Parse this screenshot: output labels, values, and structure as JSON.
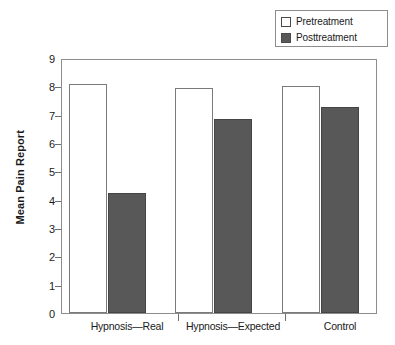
{
  "chart_data": {
    "type": "bar",
    "title": "",
    "xlabel": "",
    "ylabel": "Mean Pain Report",
    "ylim": [
      0,
      9
    ],
    "ytick_labels": [
      "0",
      "1",
      "2",
      "3",
      "4",
      "5",
      "6",
      "7",
      "8",
      "9"
    ],
    "yticks": [
      0,
      1,
      2,
      3,
      4,
      5,
      6,
      7,
      8,
      9
    ],
    "grid": false,
    "legend_position": "top-right",
    "categories": [
      "Hypnosis—Real",
      "Hypnosis—Expected",
      "Control"
    ],
    "series": [
      {
        "name": "Pretreatment",
        "color": "#ffffff",
        "values": [
          8.1,
          7.93,
          8.02
        ]
      },
      {
        "name": "Posttreatment",
        "color": "#585858",
        "values": [
          4.25,
          6.83,
          7.26
        ]
      }
    ]
  },
  "legend": {
    "entries": [
      {
        "label": "Pretreatment",
        "swatch": "#ffffff"
      },
      {
        "label": "Posttreatment",
        "swatch": "#585858"
      }
    ]
  },
  "axes": {
    "y_title": "Mean Pain Report",
    "y_labels": [
      "9",
      "8",
      "7",
      "6",
      "5",
      "4",
      "3",
      "2",
      "1",
      "0"
    ],
    "x_labels": [
      "Hypnosis—Real",
      "Hypnosis—Expected",
      "Control"
    ]
  },
  "colors": {
    "pretreatment": "#ffffff",
    "posttreatment": "#585858",
    "axis": "#8d8d8d",
    "text": "#1a1a1a"
  }
}
